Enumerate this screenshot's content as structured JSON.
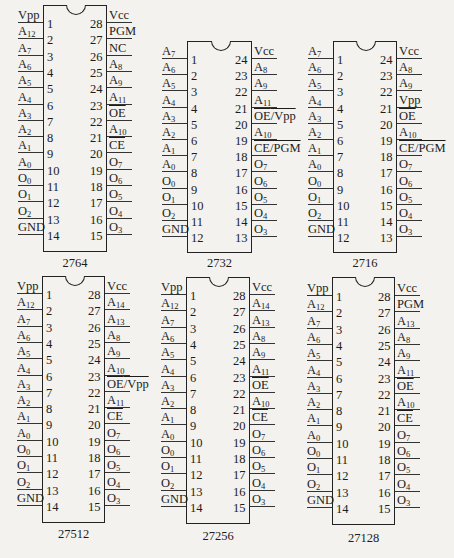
{
  "figure": {
    "chips": [
      {
        "name": "2764",
        "pins": 28,
        "geom": {
          "left": 43,
          "right": 107,
          "top": 5,
          "pin1_y": 22,
          "spacing": 16.3,
          "bottom": 252,
          "label_y": 256
        },
        "left_pins": [
          "Vpp",
          "A_12",
          "A_7",
          "A_6",
          "A_5",
          "A_4",
          "A_3",
          "A_2",
          "A_1",
          "A_0",
          "O_0",
          "O_1",
          "O_2",
          "GND"
        ],
        "right_pins": [
          "Vcc",
          "PGM",
          "NC",
          "A_8",
          "A_9",
          "A_11",
          "~OE",
          "A_10",
          "~CE",
          "O_7",
          "O_6",
          "O_5",
          "O_4",
          "O_3"
        ]
      },
      {
        "name": "2732",
        "pins": 24,
        "geom": {
          "left": 187,
          "right": 252,
          "top": 41,
          "pin1_y": 58,
          "spacing": 16.2,
          "bottom": 253,
          "label_y": 256
        },
        "left_pins": [
          "A_7",
          "A_6",
          "A_5",
          "A_4",
          "A_3",
          "A_2",
          "A_1",
          "A_0",
          "O_0",
          "O_1",
          "O_2",
          "GND"
        ],
        "right_pins": [
          "Vcc",
          "A_8",
          "A_9",
          "A_11",
          "~OE/Vpp",
          "A_10",
          "~CE/PGM",
          "O_7",
          "O_6",
          "O_5",
          "O_4",
          "O_3"
        ]
      },
      {
        "name": "2716",
        "pins": 24,
        "geom": {
          "left": 333,
          "right": 397,
          "top": 41,
          "pin1_y": 58,
          "spacing": 16.2,
          "bottom": 253,
          "label_y": 256
        },
        "left_pins": [
          "A_7",
          "A_6",
          "A_5",
          "A_4",
          "A_3",
          "A_2",
          "A_1",
          "A_0",
          "O_0",
          "O_1",
          "O_2",
          "GND"
        ],
        "right_pins": [
          "Vcc",
          "A_8",
          "A_9",
          "Vpp",
          "~OE",
          "A_10",
          "~CE/PGM",
          "O_7",
          "O_6",
          "O_5",
          "O_4",
          "O_3"
        ]
      },
      {
        "name": "27512",
        "pins": 28,
        "geom": {
          "left": 42,
          "right": 105,
          "top": 276,
          "pin1_y": 293,
          "spacing": 16.3,
          "bottom": 523,
          "label_y": 527
        },
        "left_pins": [
          "Vpp",
          "A_12",
          "A_7",
          "A_6",
          "A_5",
          "A_4",
          "A_3",
          "A_2",
          "A_1",
          "A_0",
          "O_0",
          "O_1",
          "O_2",
          "GND"
        ],
        "right_pins": [
          "Vcc",
          "A_14",
          "A_13",
          "A_8",
          "A_9",
          "A_10",
          "~OE/Vpp",
          "A_11",
          "~CE",
          "O_7",
          "O_6",
          "O_5",
          "O_4",
          "O_3"
        ]
      },
      {
        "name": "27256",
        "pins": 28,
        "geom": {
          "left": 186,
          "right": 250,
          "top": 277,
          "pin1_y": 294,
          "spacing": 16.3,
          "bottom": 524,
          "label_y": 529
        },
        "left_pins": [
          "Vpp",
          "A_12",
          "A_7",
          "A_6",
          "A_5",
          "A_4",
          "A_3",
          "A_2",
          "A_1",
          "A_0",
          "O_0",
          "O_1",
          "O_2",
          "GND"
        ],
        "right_pins": [
          "Vcc",
          "A_14",
          "A_13",
          "A_8",
          "A_9",
          "A_11",
          "~OE",
          "A_10",
          "~CE",
          "O_7",
          "O_6",
          "O_5",
          "O_4",
          "O_3"
        ]
      },
      {
        "name": "27128",
        "pins": 28,
        "geom": {
          "left": 332,
          "right": 395,
          "top": 277,
          "pin1_y": 295,
          "spacing": 16.3,
          "bottom": 525,
          "label_y": 531
        },
        "left_pins": [
          "Vpp",
          "A_12",
          "A_7",
          "A_6",
          "A_5",
          "A_4",
          "A_3",
          "A_2",
          "A_1",
          "A_0",
          "O_0",
          "O_1",
          "O_2",
          "GND"
        ],
        "right_pins": [
          "Vcc",
          "PGM",
          "A_13",
          "A_8",
          "A_9",
          "A_11",
          "~OE",
          "A_10",
          "~CE",
          "O_7",
          "O_6",
          "O_5",
          "O_4",
          "O_3"
        ]
      }
    ]
  }
}
